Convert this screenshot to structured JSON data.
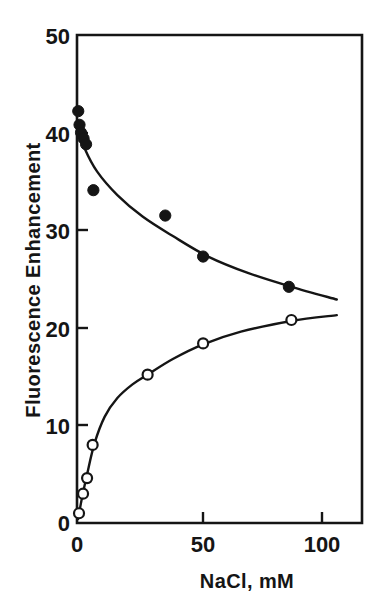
{
  "chart_data": {
    "type": "scatter",
    "title": "",
    "xlabel": "NaCl, mM",
    "ylabel": "Fluorescence Enhancement",
    "xlim": [
      0,
      113
    ],
    "ylim": [
      0,
      50
    ],
    "xticks": [
      0,
      50,
      100
    ],
    "xticklabels": [
      "0",
      "50",
      "100"
    ],
    "yticks": [
      0,
      10,
      20,
      30,
      40,
      50
    ],
    "yticklabels": [
      "0",
      "10",
      "20",
      "30",
      "40",
      "50"
    ],
    "grid": false,
    "legend": "none",
    "series": [
      {
        "name": "filled-circles-decreasing",
        "marker": "filled-circle",
        "points": [
          {
            "x": 0.5,
            "y": 42.2
          },
          {
            "x": 1.0,
            "y": 40.8
          },
          {
            "x": 1.6,
            "y": 40.0
          },
          {
            "x": 2.6,
            "y": 39.4
          },
          {
            "x": 3.6,
            "y": 38.8
          },
          {
            "x": 6.5,
            "y": 34.1
          },
          {
            "x": 35.0,
            "y": 31.5
          },
          {
            "x": 50.0,
            "y": 27.3
          },
          {
            "x": 84.0,
            "y": 24.2
          }
        ],
        "fit_curve": [
          {
            "x": 0.8,
            "y": 40.2
          },
          {
            "x": 3.0,
            "y": 38.4
          },
          {
            "x": 8.0,
            "y": 36.0
          },
          {
            "x": 16.0,
            "y": 33.6
          },
          {
            "x": 26.0,
            "y": 31.4
          },
          {
            "x": 38.0,
            "y": 29.4
          },
          {
            "x": 52.0,
            "y": 27.3
          },
          {
            "x": 68.0,
            "y": 25.6
          },
          {
            "x": 85.0,
            "y": 24.2
          },
          {
            "x": 103.0,
            "y": 22.9
          }
        ]
      },
      {
        "name": "open-circles-increasing",
        "marker": "open-circle",
        "points": [
          {
            "x": 0.8,
            "y": 1.0
          },
          {
            "x": 2.4,
            "y": 3.0
          },
          {
            "x": 4.0,
            "y": 4.6
          },
          {
            "x": 6.2,
            "y": 8.0
          },
          {
            "x": 28.0,
            "y": 15.2
          },
          {
            "x": 50.0,
            "y": 18.4
          },
          {
            "x": 85.0,
            "y": 20.8
          }
        ],
        "fit_curve": [
          {
            "x": 0.4,
            "y": 0.4
          },
          {
            "x": 2.0,
            "y": 2.6
          },
          {
            "x": 4.0,
            "y": 5.0
          },
          {
            "x": 7.0,
            "y": 8.2
          },
          {
            "x": 11.0,
            "y": 10.9
          },
          {
            "x": 16.0,
            "y": 12.8
          },
          {
            "x": 22.0,
            "y": 14.2
          },
          {
            "x": 28.0,
            "y": 15.2
          },
          {
            "x": 38.0,
            "y": 16.8
          },
          {
            "x": 50.0,
            "y": 18.3
          },
          {
            "x": 65.0,
            "y": 19.6
          },
          {
            "x": 85.0,
            "y": 20.7
          },
          {
            "x": 103.0,
            "y": 21.3
          }
        ]
      }
    ]
  },
  "axes": {
    "y_label_text": "Fluorescence Enhancement",
    "x_label_text": "NaCl, mM",
    "y_tick_50": "50",
    "y_tick_40": "40",
    "y_tick_30": "30",
    "y_tick_20": "20",
    "y_tick_10": "10",
    "y_tick_0": "0",
    "x_tick_0": "0",
    "x_tick_50": "50",
    "x_tick_100": "100"
  },
  "colors": {
    "ink": "#151515",
    "background": "#ffffff"
  }
}
